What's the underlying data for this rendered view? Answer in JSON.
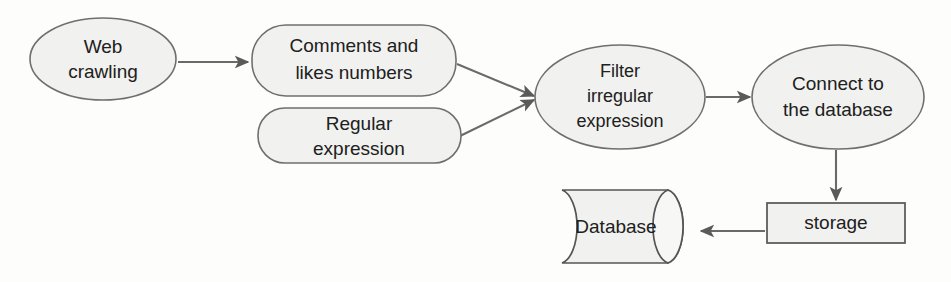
{
  "figure": {
    "type": "flowchart",
    "orientation": "left-to-right",
    "background_color": "#fdfdfc",
    "node_fill_color": "#f1f1ef",
    "node_stroke_color": "#6f6f6f",
    "edge_color": "#6a6a6a",
    "text_color": "#202020"
  },
  "nodes": [
    {
      "id": "web-crawling",
      "shape": "ellipse",
      "lines": [
        "Web",
        "crawling"
      ],
      "cx": 103,
      "cy": 59,
      "rx": 73,
      "ry": 41
    },
    {
      "id": "comments-and-likes-numbers",
      "shape": "rounded-rectangle",
      "lines": [
        "Comments and",
        "likes numbers"
      ],
      "x": 252,
      "y": 25,
      "w": 204,
      "h": 71
    },
    {
      "id": "regular-expression",
      "shape": "rounded-rectangle",
      "lines": [
        "Regular",
        "expression"
      ],
      "x": 258,
      "y": 108,
      "w": 203,
      "h": 55
    },
    {
      "id": "filter-irregular-expression",
      "shape": "ellipse",
      "lines": [
        "Filter",
        "irregular",
        "expression"
      ],
      "cx": 620,
      "cy": 97,
      "rx": 85,
      "ry": 52
    },
    {
      "id": "connect-to-the-database",
      "shape": "ellipse",
      "lines": [
        "Connect to",
        "the database"
      ],
      "cx": 838,
      "cy": 97,
      "rx": 86,
      "ry": 52
    },
    {
      "id": "storage",
      "shape": "rectangle",
      "lines": [
        "storage"
      ],
      "x": 767,
      "y": 203,
      "w": 138,
      "h": 40
    },
    {
      "id": "database",
      "shape": "cylinder-horizontal",
      "lines": [
        "Database"
      ],
      "x": 562,
      "y": 190,
      "w": 135,
      "h": 73
    }
  ],
  "edges": [
    {
      "id": "web-crawling-to-comments",
      "from": "web-crawling",
      "to": "comments-and-likes-numbers",
      "arrowhead": "filled-triangle"
    },
    {
      "id": "comments-to-filter",
      "from": "comments-and-likes-numbers",
      "to": "filter-irregular-expression",
      "arrowhead": "filled-triangle"
    },
    {
      "id": "regular-expression-to-filter",
      "from": "regular-expression",
      "to": "filter-irregular-expression",
      "arrowhead": "filled-triangle"
    },
    {
      "id": "filter-to-connect",
      "from": "filter-irregular-expression",
      "to": "connect-to-the-database",
      "arrowhead": "filled-triangle"
    },
    {
      "id": "connect-to-storage",
      "from": "connect-to-the-database",
      "to": "storage",
      "arrowhead": "filled-triangle"
    },
    {
      "id": "storage-to-database",
      "from": "storage",
      "to": "database",
      "arrowhead": "filled-triangle"
    }
  ],
  "labels": {
    "web_crawling_line1": "Web",
    "web_crawling_line2": "crawling",
    "comments_line1": "Comments and",
    "comments_line2": "likes numbers",
    "regular_line1": "Regular",
    "regular_line2": "expression",
    "filter_line1": "Filter",
    "filter_line2": "irregular",
    "filter_line3": "expression",
    "connect_line1": "Connect to",
    "connect_line2": "the database",
    "storage_label": "storage",
    "database_label": "Database"
  }
}
